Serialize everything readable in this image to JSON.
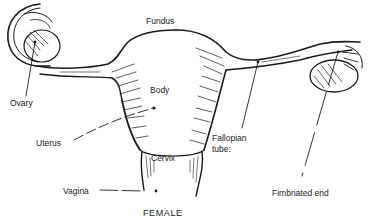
{
  "diagram": {
    "title": "FEMALE",
    "labels": {
      "fundus": "Fundus",
      "body": "Body",
      "ovary": "Ovary",
      "uterus": "Uterus",
      "cervix": "Cervix",
      "vagina": "Vagina",
      "fallopian_tube_line1": "Fallopian",
      "fallopian_tube_line2": "tube:",
      "fimbriated_end": "Fimbriated end"
    },
    "colors": {
      "ink": "#1a1a1a",
      "background": "#ffffff"
    }
  }
}
